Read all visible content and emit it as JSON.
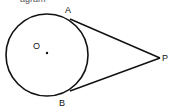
{
  "diagram": {
    "title_fragment": "agram",
    "circle": {
      "center_label": "O",
      "cx": 47,
      "cy": 55,
      "r": 41
    },
    "points": {
      "A": {
        "label": "A",
        "x": 70,
        "y": 19
      },
      "B": {
        "label": "B",
        "x": 70,
        "y": 91
      },
      "P": {
        "label": "P",
        "x": 160,
        "y": 58
      }
    },
    "segments": [
      "PA",
      "PB"
    ],
    "stroke_color": "#111111"
  }
}
